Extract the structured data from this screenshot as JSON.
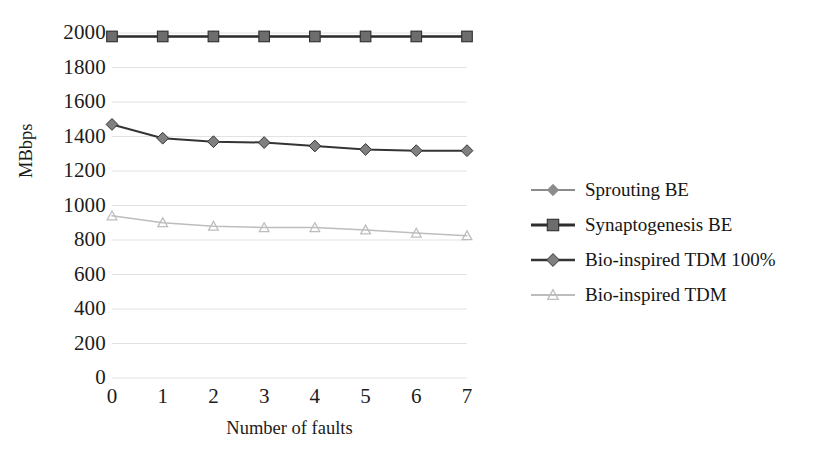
{
  "chart_data": {
    "type": "line",
    "title": "",
    "xlabel": "Number of faults",
    "ylabel": "MBbps",
    "x": [
      0,
      1,
      2,
      3,
      4,
      5,
      6,
      7
    ],
    "xtick_labels": [
      "0",
      "1",
      "2",
      "3",
      "4",
      "5",
      "6",
      "7"
    ],
    "ytick_labels": [
      "0",
      "200",
      "400",
      "600",
      "800",
      "1000",
      "1200",
      "1400",
      "1600",
      "1800",
      "2000"
    ],
    "ytick_values": [
      0,
      200,
      400,
      600,
      800,
      1000,
      1200,
      1400,
      1600,
      1800,
      2000
    ],
    "ylim": [
      0,
      2000
    ],
    "xlim": [
      0,
      7
    ],
    "grid": true,
    "legend_position": "right",
    "series": [
      {
        "name": "Sprouting BE",
        "marker": "diamond",
        "color": "#8c8c8c",
        "line_color": "#8c8c8c",
        "values": [
          1980,
          1980,
          1980,
          1980,
          1980,
          1980,
          1980,
          1980
        ]
      },
      {
        "name": "Synaptogenesis BE",
        "marker": "square",
        "color": "#6d6d6d",
        "line_color": "#2e2e2e",
        "values": [
          1980,
          1980,
          1980,
          1980,
          1980,
          1980,
          1980,
          1980
        ]
      },
      {
        "name": "Bio-inspired TDM 100%",
        "marker": "diamond",
        "color": "#808080",
        "line_color": "#343434",
        "values": [
          1470,
          1390,
          1370,
          1365,
          1345,
          1325,
          1318,
          1318
        ]
      },
      {
        "name": "Bio-inspired TDM",
        "marker": "triangle",
        "color": "#cfcfcf",
        "line_color": "#bdbdbd",
        "values": [
          940,
          900,
          880,
          872,
          872,
          858,
          840,
          825
        ]
      }
    ]
  },
  "axes": {
    "y_title": "MBbps",
    "x_title": "Number of faults"
  },
  "legend": {
    "items": [
      {
        "label": "Sprouting BE",
        "marker": "diamond-marker-icon"
      },
      {
        "label": "Synaptogenesis BE",
        "marker": "square-marker-icon"
      },
      {
        "label": "Bio-inspired TDM 100%",
        "marker": "diamond-marker-icon"
      },
      {
        "label": "Bio-inspired TDM",
        "marker": "triangle-marker-icon"
      }
    ]
  },
  "colors": {
    "grid": "#e2e2e2",
    "text": "#1c1c1c",
    "background": "#ffffff"
  }
}
